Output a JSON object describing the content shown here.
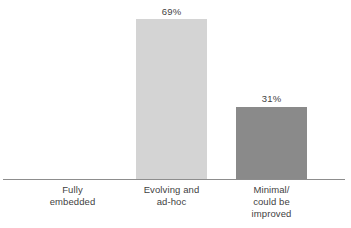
{
  "chart_data": {
    "type": "bar",
    "title": "",
    "subtitle": "",
    "xlabel": "",
    "ylabel": "",
    "categories": [
      "Fully embedded",
      "Evolving and ad-hoc",
      "Minimal/ could be improved"
    ],
    "category_lines": [
      [
        "Fully",
        "embedded"
      ],
      [
        "Evolving and",
        "ad-hoc"
      ],
      [
        "Minimal/",
        "could be",
        "improved"
      ]
    ],
    "values": [
      0,
      69,
      31
    ],
    "value_labels": [
      "",
      "69%",
      "31%"
    ],
    "ylim": [
      0,
      100
    ],
    "grid": false,
    "legend": false,
    "bar_colors": [
      "#ffffff",
      "#d4d4d4",
      "#8a8a8a"
    ],
    "axis_color": "#8d8d8d",
    "text_color": "#3f3f3f",
    "background": "#ffffff"
  }
}
